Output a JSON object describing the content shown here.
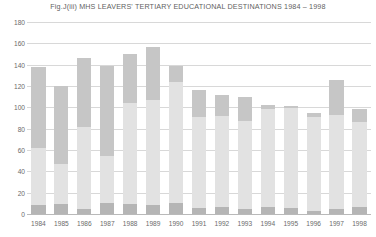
{
  "chart_data": {
    "type": "bar",
    "title": "Fig.J(iii) MHS LEAVERS' TERTIARY EDUCATIONAL DESTINATIONS 1984 – 1998",
    "xlabel": "",
    "ylabel": "",
    "ylim": [
      0,
      180
    ],
    "yticks": [
      0,
      20,
      40,
      60,
      80,
      100,
      120,
      140,
      160,
      180
    ],
    "ytick_labels": [
      "0",
      "20",
      "40",
      "60",
      "80",
      "100",
      "120",
      "140",
      "160",
      "180"
    ],
    "grid": true,
    "legend": "none",
    "stacked": true,
    "categories": [
      "1984",
      "1985",
      "1986",
      "1987",
      "1988",
      "1989",
      "1990",
      "1991",
      "1992",
      "1993",
      "1994",
      "1995",
      "1996",
      "1997",
      "1998"
    ],
    "series": [
      {
        "name": "segment-bottom-dark",
        "color": "#b5b5b5",
        "values": [
          8,
          9,
          5,
          10,
          9,
          8,
          10,
          6,
          7,
          5,
          7,
          6,
          3,
          5,
          7
        ]
      },
      {
        "name": "segment-middle-light",
        "color": "#e2e2e2",
        "values": [
          54,
          38,
          77,
          44,
          95,
          99,
          114,
          85,
          85,
          82,
          91,
          93,
          88,
          88,
          79
        ]
      },
      {
        "name": "segment-top-medium",
        "color": "#c6c6c6",
        "values": [
          76,
          73,
          64,
          85,
          46,
          50,
          15,
          25,
          20,
          23,
          4,
          2,
          4,
          33,
          12
        ]
      }
    ],
    "totals": [
      138,
      120,
      146,
      139,
      150,
      157,
      139,
      116,
      112,
      110,
      102,
      101,
      95,
      126,
      98
    ]
  },
  "colors": {
    "background": "#ffffff",
    "gridline": "#d8d8d8",
    "axis": "#b9b9b9",
    "text": "#5f5f5f",
    "bar_dark": "#b5b5b5",
    "bar_light": "#e2e2e2",
    "bar_medium": "#c6c6c6"
  }
}
